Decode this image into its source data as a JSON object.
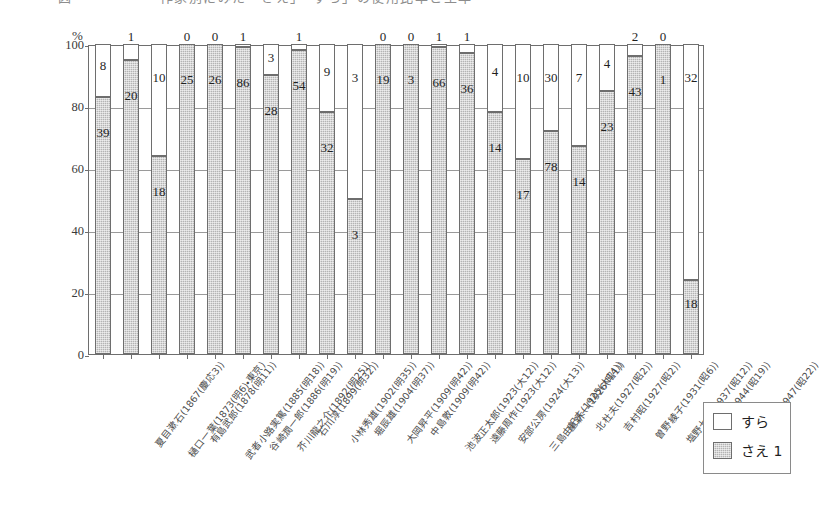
{
  "top_strip": {
    "cropped_title": "図　　　　　　作家別にみた「さえ」「すら」の使用比率と生年"
  },
  "axis": {
    "y_unit": "%",
    "y_ticks": [
      "100",
      "80",
      "60",
      "40",
      "20",
      "0"
    ],
    "y_min": 0,
    "y_max": 100
  },
  "legend": {
    "items": [
      {
        "label": "すら",
        "color": "#ffffff",
        "key": "sura"
      },
      {
        "label": "さえ 1",
        "color": "#b4b4b4",
        "key": "sae"
      }
    ]
  },
  "chart_data": {
    "type": "bar",
    "subtype": "stacked-percent",
    "title": "",
    "xlabel": "",
    "ylabel": "%",
    "ylim": [
      0,
      100
    ],
    "grid": true,
    "legend_position": "bottom-right",
    "series": [
      {
        "name": "さえ 1",
        "key": "sae",
        "color": "#b4b4b4"
      },
      {
        "name": "すら",
        "key": "sura",
        "color": "#ffffff"
      }
    ],
    "categories": [
      "夏目漱石(1867(慶応3))",
      "樋口一葉(1873(明6)・東京)",
      "有島武郎(1878(明11))",
      "武者小路実篤(1885(明18))",
      "谷崎潤一郎(1886(明19))",
      "芥川龍之介(1892(明25))",
      "石川淳(1899(明32))",
      "小林秀雄(1902(明35))",
      "堀辰雄(1904(明37))",
      "大岡昇平(1909(明42))",
      "中島敦(1909(明42))",
      "池波正太郎(1923(大12))",
      "遠藤周作(1923(大12))",
      "安部公房(1924(大13))",
      "三島由紀夫(1925(大14))",
      "星新一(1926(昭1))",
      "北杜夫(1927(昭2))",
      "吉村昭(1927(昭2))",
      "曽野綾子(1931(昭6))",
      "塩野七生(1937(昭12))",
      "椎名誠(1944(昭19))",
      "沢木耕太郎(1947(昭22))"
    ],
    "bars": [
      {
        "label": "夏目漱石(1867(慶応3))",
        "sae": 39,
        "sura": 8,
        "sae_pct": 83,
        "sura_pct": 17
      },
      {
        "label": "樋口一葉(1873(明6)・東京)",
        "sae": 20,
        "sura": 1,
        "sae_pct": 95,
        "sura_pct": 5
      },
      {
        "label": "有島武郎(1878(明11))",
        "sae": 18,
        "sura": 10,
        "sae_pct": 64,
        "sura_pct": 36
      },
      {
        "label": "武者小路実篤(1885(明18))",
        "sae": 25,
        "sura": 0,
        "sae_pct": 100,
        "sura_pct": 0
      },
      {
        "label": "谷崎潤一郎(1886(明19))",
        "sae": 26,
        "sura": 0,
        "sae_pct": 100,
        "sura_pct": 0
      },
      {
        "label": "芥川龍之介(1892(明25))",
        "sae": 86,
        "sura": 1,
        "sae_pct": 99,
        "sura_pct": 1
      },
      {
        "label": "石川淳(1899(明32))",
        "sae": 28,
        "sura": 3,
        "sae_pct": 90,
        "sura_pct": 10
      },
      {
        "label": "小林秀雄(1902(明35))",
        "sae": 54,
        "sura": 1,
        "sae_pct": 98,
        "sura_pct": 2
      },
      {
        "label": "堀辰雄(1904(明37))",
        "sae": 32,
        "sura": 9,
        "sae_pct": 78,
        "sura_pct": 22
      },
      {
        "label": "大岡昇平(1909(明42))",
        "sae": 3,
        "sura": 3,
        "sae_pct": 50,
        "sura_pct": 50
      },
      {
        "label": "中島敦(1909(明42))",
        "sae": 19,
        "sura": 0,
        "sae_pct": 100,
        "sura_pct": 0
      },
      {
        "label": "池波正太郎(1923(大12))",
        "sae": 3,
        "sura": 0,
        "sae_pct": 100,
        "sura_pct": 0
      },
      {
        "label": "遠藤周作(1923(大12))",
        "sae": 66,
        "sura": 1,
        "sae_pct": 99,
        "sura_pct": 1
      },
      {
        "label": "安部公房(1924(大13))",
        "sae": 36,
        "sura": 1,
        "sae_pct": 97,
        "sura_pct": 3
      },
      {
        "label": "三島由紀夫(1925(大14))",
        "sae": 14,
        "sura": 4,
        "sae_pct": 78,
        "sura_pct": 22
      },
      {
        "label": "星新一(1926(昭1))",
        "sae": 17,
        "sura": 10,
        "sae_pct": 63,
        "sura_pct": 37
      },
      {
        "label": "北杜夫(1927(昭2))",
        "sae": 78,
        "sura": 30,
        "sae_pct": 72,
        "sura_pct": 28
      },
      {
        "label": "吉村昭(1927(昭2))",
        "sae": 14,
        "sura": 7,
        "sae_pct": 67,
        "sura_pct": 33
      },
      {
        "label": "曽野綾子(1931(昭6))",
        "sae": 23,
        "sura": 4,
        "sae_pct": 85,
        "sura_pct": 15
      },
      {
        "label": "塩野七生(1937(昭12))",
        "sae": 43,
        "sura": 2,
        "sae_pct": 96,
        "sura_pct": 4
      },
      {
        "label": "椎名誠(1944(昭19))",
        "sae": 1,
        "sura": 0,
        "sae_pct": 100,
        "sura_pct": 0
      },
      {
        "label": "沢木耕太郎(1947(昭22))",
        "sae": 18,
        "sura": 32,
        "sae_pct": 24,
        "sura_pct": 76
      }
    ]
  }
}
